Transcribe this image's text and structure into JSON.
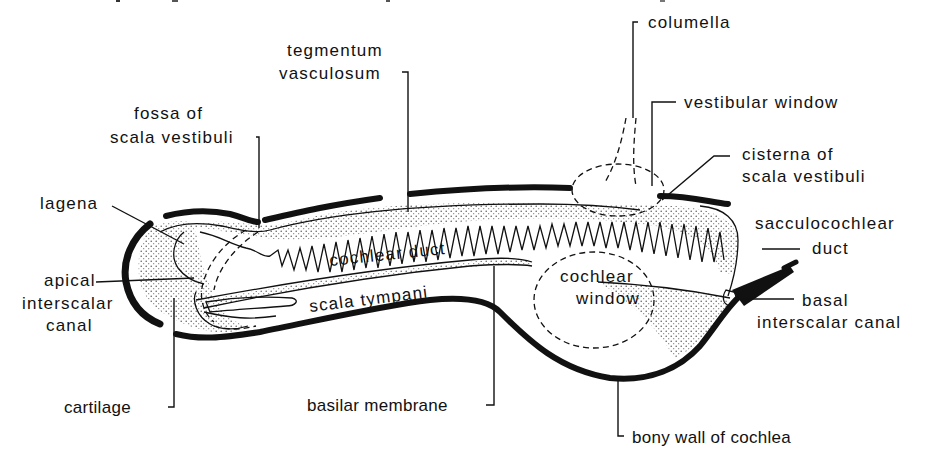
{
  "figure": {
    "type": "anatomical diagram",
    "colors": {
      "ink": "#111111",
      "background": "#ffffff",
      "stipple": "#555555"
    }
  },
  "labels": {
    "tegmentum_vasculosum": [
      "tegmentum",
      "vasculosum"
    ],
    "columella": "columella",
    "fossa_of_scala_vestibuli": [
      "fossa of",
      "scala vestibuli"
    ],
    "vestibular_window": "vestibular window",
    "cisterna_of_scala_vestibuli": [
      "cisterna of",
      "scala vestibuli"
    ],
    "lagena": "lagena",
    "sacculocochlear_duct": [
      "sacculocochlear",
      "duct"
    ],
    "apical_interscalar_canal": [
      "apical",
      "interscalar",
      "canal"
    ],
    "cochlear_duct": "cochlear duct",
    "cochlear_window": [
      "cochlear",
      "window"
    ],
    "scala_tympani": "scala tympani",
    "basal_interscalar_canal": [
      "basal",
      "interscalar canal"
    ],
    "cartilage": "cartilage",
    "basilar_membrane": "basilar membrane",
    "bony_wall_of_cochlea": "bony wall of cochlea"
  }
}
